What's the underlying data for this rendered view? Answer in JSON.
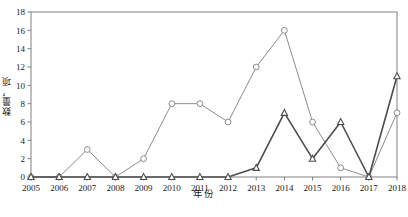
{
  "chart_data": {
    "type": "line",
    "title": "",
    "xlabel": "年份",
    "ylabel": "数量，项",
    "categories": [
      "2005",
      "2006",
      "2007",
      "2008",
      "2009",
      "2010",
      "2011",
      "2012",
      "2013",
      "2014",
      "2015",
      "2016",
      "2017",
      "2018"
    ],
    "series": [
      {
        "name": "circle-series",
        "marker": "circle",
        "values": [
          0,
          0,
          3,
          0,
          2,
          8,
          8,
          6,
          12,
          16,
          6,
          1,
          0,
          7
        ]
      },
      {
        "name": "triangle-series",
        "marker": "triangle",
        "values": [
          0,
          0,
          0,
          0,
          0,
          0,
          0,
          0,
          1,
          7,
          2,
          6,
          0,
          11
        ]
      }
    ],
    "ylim": [
      0,
      18
    ],
    "yticks": [
      0,
      2,
      4,
      6,
      8,
      10,
      12,
      14,
      16,
      18
    ],
    "xlim_index": [
      0,
      13
    ],
    "grid": false,
    "legend": "none",
    "axis_color": "#808080",
    "series_colors": [
      "#8c8c8c",
      "#4d4d4d"
    ]
  },
  "axis": {
    "y_tick_labels": [
      "0",
      "2",
      "4",
      "6",
      "8",
      "10",
      "12",
      "14",
      "16",
      "18"
    ],
    "x_tick_labels": [
      "2005",
      "2006",
      "2007",
      "2008",
      "2009",
      "2010",
      "2011",
      "2012",
      "2013",
      "2014",
      "2015",
      "2016",
      "2017",
      "2018"
    ],
    "y_title": "数量，项",
    "x_title": "年份"
  },
  "caption": {
    "text": ""
  }
}
